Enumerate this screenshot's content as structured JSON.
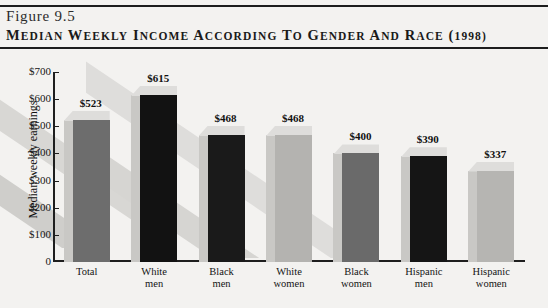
{
  "figure": {
    "number_label": "Figure 9.5",
    "title": "MEDIAN WEEKLY INCOME ACCORDING TO GENDER AND RACE (1998)"
  },
  "chart_data": {
    "type": "bar",
    "title": "Median Weekly Income According to Gender and Race (1998)",
    "xlabel": "",
    "ylabel": "Median weekly earnings",
    "ylim": [
      0,
      700
    ],
    "ytick_labels": [
      "$700",
      "$600",
      "$500",
      "$400",
      "$300",
      "$200",
      "$100",
      "0"
    ],
    "ytick_values": [
      700,
      600,
      500,
      400,
      300,
      200,
      100,
      0
    ],
    "grid": false,
    "legend": "none",
    "categories": [
      "Total",
      "White men",
      "Black men",
      "White women",
      "Black women",
      "Hispanic men",
      "Hispanic women"
    ],
    "category_lines": [
      [
        "Total",
        ""
      ],
      [
        "White",
        "men"
      ],
      [
        "Black",
        "men"
      ],
      [
        "White",
        "women"
      ],
      [
        "Black",
        "women"
      ],
      [
        "Hispanic",
        "men"
      ],
      [
        "Hispanic",
        "women"
      ]
    ],
    "values": [
      523,
      615,
      468,
      468,
      400,
      390,
      337
    ],
    "data_labels": [
      "$523",
      "$615",
      "$468",
      "$468",
      "$400",
      "$390",
      "$337"
    ],
    "bar_colors": [
      "#6d6d6d",
      "#121212",
      "#1a1a1a",
      "#b4b3b0",
      "#6a6a6a",
      "#151515",
      "#b6b5b2"
    ]
  },
  "colors": {
    "page_background": "#f3f2f0",
    "rule": "#1d1d1d",
    "axis": "#1e1e1e",
    "stripe_light": "#dedddb",
    "stripe_dark": "#cfcecb"
  }
}
